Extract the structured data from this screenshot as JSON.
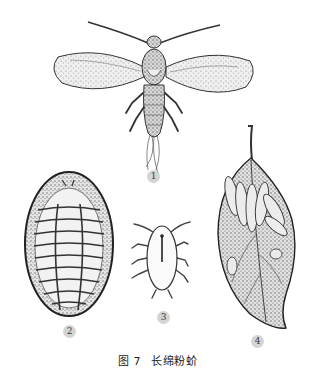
{
  "figure": {
    "number_label": "图 7",
    "title": "长绵粉蚧",
    "panels": [
      {
        "id": 1,
        "label": "1",
        "subject": "winged adult male"
      },
      {
        "id": 2,
        "label": "2",
        "subject": "oval adult female (dorsal view, segmented)"
      },
      {
        "id": 3,
        "label": "3",
        "subject": "nymph"
      },
      {
        "id": 4,
        "label": "4",
        "subject": "leaf with elongated cottony ovisacs"
      }
    ]
  },
  "colors": {
    "ink": "#2a2a2a",
    "stipple_fill": "#e6e6e6",
    "label_circle": "#d4d4d4",
    "background": "#ffffff"
  }
}
